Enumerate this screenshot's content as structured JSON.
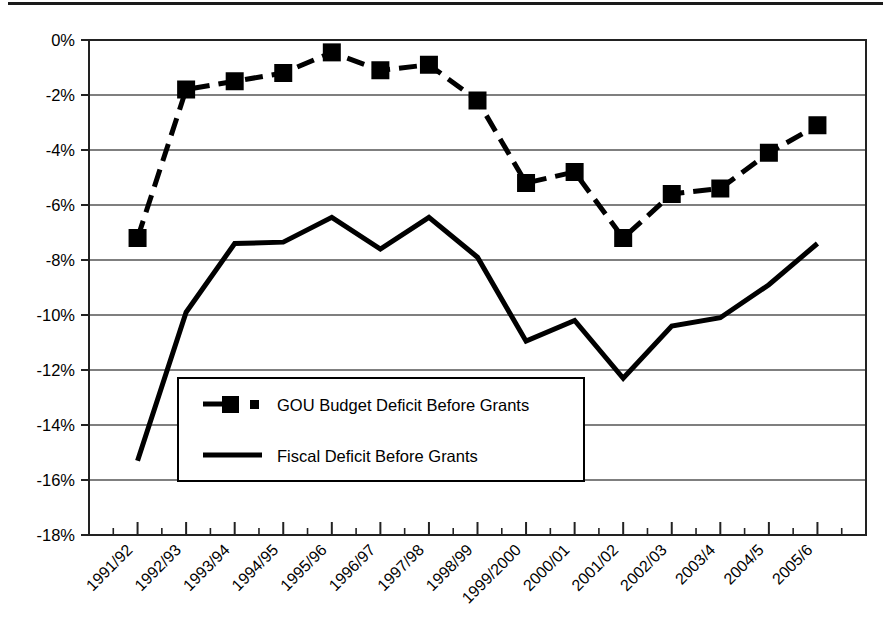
{
  "chart_data": {
    "type": "line",
    "title": "",
    "xlabel": "",
    "ylabel": "",
    "grid": true,
    "legend_position": "inside-lower-left",
    "ylim": [
      -18,
      0
    ],
    "ytick_labels": [
      "0%",
      "-2%",
      "-4%",
      "-6%",
      "-8%",
      "-10%",
      "-12%",
      "-14%",
      "-16%",
      "-18%"
    ],
    "ytick_values": [
      0,
      -2,
      -4,
      -6,
      -8,
      -10,
      -12,
      -14,
      -16,
      -18
    ],
    "categories": [
      "1991/92",
      "1992/93",
      "1993/94",
      "1994/95",
      "1995/96",
      "1996/97",
      "1997/98",
      "1998/99",
      "1999/2000",
      "2000/01",
      "2001/02",
      "2002/03",
      "2003/4",
      "2004/5",
      "2005/6"
    ],
    "series": [
      {
        "name": "GOU Budget Deficit Before Grants",
        "style": "dashed-with-square-markers",
        "color": "#000000",
        "values": [
          -7.2,
          -1.8,
          -1.5,
          -1.2,
          -0.45,
          -1.1,
          -0.9,
          -2.2,
          -5.2,
          -4.8,
          -7.2,
          -5.6,
          -5.4,
          -4.1,
          -3.1
        ]
      },
      {
        "name": "Fiscal Deficit Before Grants",
        "style": "solid",
        "color": "#000000",
        "values": [
          -15.3,
          -9.9,
          -7.4,
          -7.35,
          -6.45,
          -7.6,
          -6.45,
          -7.9,
          -10.95,
          -10.2,
          -12.3,
          -10.4,
          -10.1,
          -8.9,
          -7.4
        ]
      }
    ]
  },
  "legend": {
    "entries": [
      {
        "label": "GOU Budget Deficit Before Grants",
        "marker": "dashed-square-marker"
      },
      {
        "label": "Fiscal Deficit Before Grants",
        "marker": "solid-line-marker"
      }
    ]
  },
  "colors": {
    "ink": "#000000",
    "gridline": "#555555",
    "axis": "#222222",
    "background": "#ffffff"
  }
}
